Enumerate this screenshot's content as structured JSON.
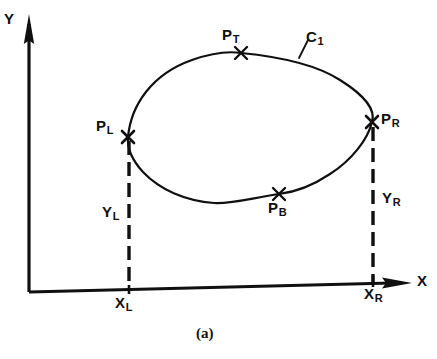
{
  "figure": {
    "caption": "(a)",
    "axes": {
      "y_label": "Y",
      "x_label": "X",
      "origin": {
        "x": 29,
        "y": 292
      }
    },
    "curve": {
      "name": "C",
      "name_sub": "1",
      "description": "closed convex contour"
    },
    "points": [
      {
        "id": "P_T",
        "base": "P",
        "sub": "T",
        "marker_x": 241,
        "marker_y": 53,
        "label_x": 222,
        "label_y": 27
      },
      {
        "id": "P_L",
        "base": "P",
        "sub": "L",
        "marker_x": 128,
        "marker_y": 137,
        "label_x": 96,
        "label_y": 118
      },
      {
        "id": "P_R",
        "base": "P",
        "sub": "R",
        "marker_x": 372,
        "marker_y": 122,
        "label_x": 381,
        "label_y": 111
      },
      {
        "id": "P_B",
        "base": "P",
        "sub": "B",
        "marker_x": 279,
        "marker_y": 194,
        "label_x": 268,
        "label_y": 200
      }
    ],
    "extents": [
      {
        "id": "Y_L",
        "base": "Y",
        "sub": "L",
        "label_x": 102,
        "label_y": 204
      },
      {
        "id": "Y_R",
        "base": "Y",
        "sub": "R",
        "label_x": 382,
        "label_y": 190
      },
      {
        "id": "X_L",
        "base": "X",
        "sub": "L",
        "label_x": 115,
        "label_y": 295
      },
      {
        "id": "X_R",
        "base": "X",
        "sub": "R",
        "label_x": 364,
        "label_y": 286
      }
    ],
    "colors": {
      "ink": "#101010",
      "background": "#ffffff"
    }
  }
}
